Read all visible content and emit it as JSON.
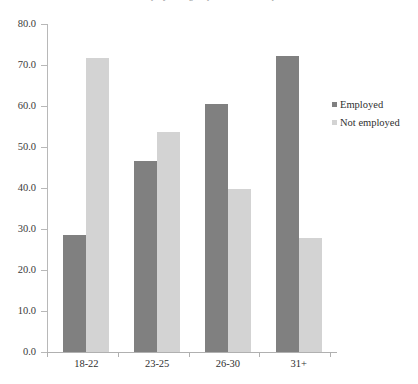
{
  "chart_data": {
    "type": "bar",
    "title": "",
    "xlabel": "",
    "ylabel": "",
    "categories": [
      "18-22",
      "23-25",
      "26-30",
      "31+"
    ],
    "series": [
      {
        "name": "Employed",
        "color": "#808080",
        "values": [
          28.5,
          46.5,
          60.5,
          72.2
        ]
      },
      {
        "name": "Not employed",
        "color": "#d3d3d3",
        "values": [
          71.8,
          53.7,
          39.8,
          27.8
        ]
      }
    ],
    "ylim": [
      0,
      80
    ],
    "ytick_labels": [
      "0.0",
      "10.0",
      "20.0",
      "30.0",
      "40.0",
      "50.0",
      "60.0",
      "70.0",
      "80.0"
    ],
    "ytick_values": [
      0,
      10,
      20,
      30,
      40,
      50,
      60,
      70,
      80
    ],
    "grid": false,
    "legend_position": "right",
    "legend": [
      {
        "label": "Employed",
        "color": "#808080"
      },
      {
        "label": "Not employed",
        "color": "#d3d3d3"
      }
    ]
  },
  "caption": {
    "clipped_text": "the employment grouped bar chart caption"
  }
}
